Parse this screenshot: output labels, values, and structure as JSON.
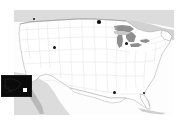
{
  "figure": {
    "background_color": "#ffffff",
    "map_background_color": "#fdfdfd"
  },
  "map": {
    "name": "usa-contiguous-states-map",
    "projection_hint": "albers-usa",
    "land_fill": "#ffffff",
    "state_border_color": "#d4d4d4",
    "national_border_color": "#9a9a9a",
    "surrounding_land_fill": "#dcdcdc",
    "water_fill": "#8e8e8e",
    "regions": [
      {
        "name": "canada",
        "label": "Canada",
        "fill": "#dcdcdc"
      },
      {
        "name": "mexico",
        "label": "Mexico",
        "fill": "#dcdcdc"
      },
      {
        "name": "great-lakes",
        "label": "Great Lakes",
        "fill": "#8e8e8e"
      },
      {
        "name": "atlantic-ocean",
        "label": "Atlantic Ocean",
        "fill": "#ffffff"
      },
      {
        "name": "gulf-of-mexico",
        "label": "Gulf of Mexico",
        "fill": "#ffffff"
      }
    ]
  },
  "markers": {
    "color": "#111111",
    "shape": "circle",
    "count": 6,
    "points": [
      {
        "name": "marker-pacific-northwest",
        "x": 20,
        "y": 9,
        "size": 2.5
      },
      {
        "name": "marker-northern-plains",
        "x": 85,
        "y": 12,
        "size": 3.5
      },
      {
        "name": "marker-mountain-west",
        "x": 40,
        "y": 37,
        "size": 3.0
      },
      {
        "name": "marker-great-lakes",
        "x": 112,
        "y": 33,
        "size": 3.0
      },
      {
        "name": "marker-gulf-south",
        "x": 100,
        "y": 82,
        "size": 3.0
      },
      {
        "name": "marker-southeast",
        "x": 130,
        "y": 83,
        "size": 2.5
      }
    ]
  },
  "inset": {
    "name": "alaska-inset-panel",
    "label": "Inset",
    "background_color": "#0a0a0a",
    "border_color": "#1a1a1a",
    "outline_color": "#2a2a2a",
    "marker": {
      "name": "inset-marker",
      "color": "#ffffff",
      "shape": "square",
      "x": 21,
      "y": 12,
      "size": 4
    }
  }
}
